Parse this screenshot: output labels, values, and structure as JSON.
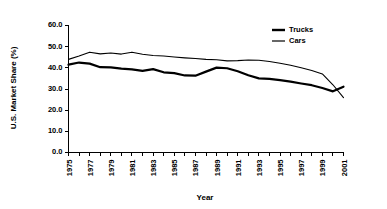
{
  "chart_data": {
    "type": "line",
    "title": "",
    "xlabel": "Year",
    "ylabel": "U.S. Market Share (%)",
    "xlim": [
      1975,
      2001
    ],
    "ylim": [
      0.0,
      60.0
    ],
    "yticks": [
      "0.0",
      "10.0",
      "20.0",
      "30.0",
      "40.0",
      "50.0",
      "60.0"
    ],
    "ytick_values": [
      0.0,
      10.0,
      20.0,
      30.0,
      40.0,
      50.0,
      60.0
    ],
    "grid": false,
    "legend_position": "top-right",
    "x": [
      1975,
      1976,
      1977,
      1978,
      1979,
      1980,
      1981,
      1982,
      1983,
      1984,
      1985,
      1986,
      1987,
      1988,
      1989,
      1990,
      1991,
      1992,
      1993,
      1994,
      1995,
      1996,
      1997,
      1998,
      1999,
      2000,
      2001
    ],
    "xtick_labels": [
      "1975",
      "",
      "1977",
      "",
      "1979",
      "",
      "1981",
      "",
      "1983",
      "",
      "1985",
      "",
      "1987",
      "",
      "1989",
      "",
      "1991",
      "",
      "1993",
      "",
      "1995",
      "",
      "1997",
      "",
      "1999",
      "",
      "2001"
    ],
    "series": [
      {
        "name": "Trucks",
        "style": "thick",
        "values": [
          41.5,
          42.5,
          42.0,
          40.3,
          40.2,
          39.6,
          39.3,
          38.6,
          39.4,
          37.9,
          37.5,
          36.4,
          36.3,
          38.2,
          40.1,
          39.8,
          38.4,
          36.5,
          35.0,
          34.8,
          34.2,
          33.5,
          32.6,
          31.8,
          30.5,
          28.9,
          31.1
        ]
      },
      {
        "name": "Cars",
        "style": "thin",
        "values": [
          44.0,
          45.6,
          47.4,
          46.6,
          47.0,
          46.5,
          47.4,
          46.4,
          45.8,
          45.6,
          45.1,
          44.7,
          44.4,
          44.0,
          43.8,
          43.3,
          43.4,
          43.7,
          43.6,
          43.0,
          42.2,
          41.2,
          40.0,
          38.7,
          37.1,
          32.0,
          25.9
        ]
      }
    ],
    "legend": [
      {
        "label": "Trucks",
        "style": "thick"
      },
      {
        "label": "Cars",
        "style": "thin"
      }
    ]
  }
}
